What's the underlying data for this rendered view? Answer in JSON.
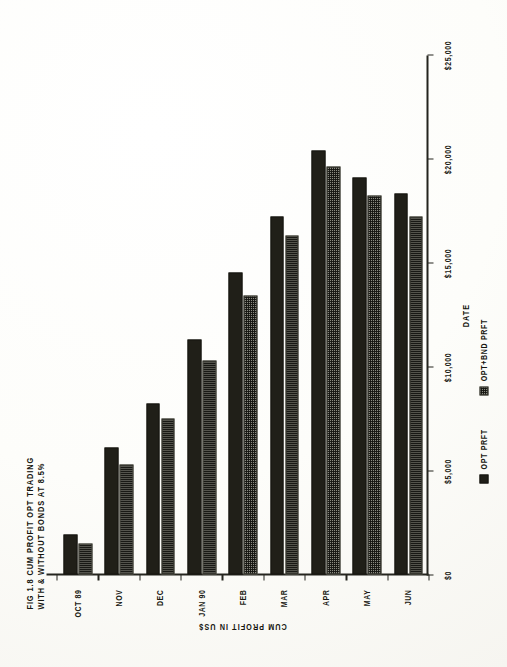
{
  "figure": {
    "title_line1": "FIG 1.8 CUM PROFIT OPT TRADING",
    "title_line2": "WITH & WITHOUT BONDS AT 8.5%"
  },
  "legend": {
    "items": [
      {
        "label": "OPT PRFT",
        "style": "solid",
        "color": "#201f18"
      },
      {
        "label": "OPT+BND PRFT",
        "style": "hatch",
        "color": "#8a8a80"
      }
    ]
  },
  "chart_data": {
    "type": "bar",
    "orientation": "vertical",
    "title": "FIG 1.8 CUM PROFIT OPT TRADING WITH & WITHOUT BONDS AT 8.5%",
    "xlabel": "DATE",
    "ylabel": "CUM PROFIT IN US$",
    "categories": [
      "OCT 89",
      "NOV",
      "DEC",
      "JAN 90",
      "FEB",
      "MAR",
      "APR",
      "MAY",
      "JUN"
    ],
    "ytick_labels": [
      "$0",
      "$5,000",
      "$10,000",
      "$15,000",
      "$20,000",
      "$25,000"
    ],
    "ytick_values": [
      0,
      5000,
      10000,
      15000,
      20000,
      25000
    ],
    "ylim": [
      0,
      25000
    ],
    "grid": false,
    "legend_position": "bottom",
    "series": [
      {
        "name": "OPT PRFT",
        "style": "solid",
        "color": "#201f18",
        "values": [
          1900,
          6100,
          8200,
          11300,
          14500,
          17200,
          20400,
          19100,
          18300
        ]
      },
      {
        "name": "OPT+BND PRFT",
        "style": "hatch",
        "color": "#8a8a80",
        "values": [
          1500,
          5300,
          7500,
          10300,
          13400,
          16300,
          19600,
          18200,
          17200
        ]
      }
    ]
  }
}
